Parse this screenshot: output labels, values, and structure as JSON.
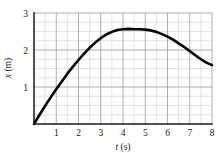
{
  "chart_data": {
    "type": "line",
    "title": "",
    "xlabel": "t (s)",
    "ylabel": "x (m)",
    "xlim": [
      0,
      8
    ],
    "ylim": [
      0,
      3
    ],
    "grid": true,
    "grid_major_x": 1,
    "grid_minor_x": 0.5,
    "grid_major_y": 1,
    "grid_minor_y": 0.25,
    "legend": "none",
    "xticks": [
      1,
      2,
      3,
      4,
      5,
      6,
      7,
      8
    ],
    "xtick_labels": [
      "1",
      "2",
      "3",
      "4",
      "5",
      "6",
      "7",
      "8"
    ],
    "yticks": [
      1,
      2,
      3
    ],
    "ytick_labels": [
      "1",
      "2",
      "3"
    ],
    "series": [
      {
        "name": "position",
        "color": "#000000",
        "linewidth": 2.6,
        "x": [
          0.0,
          0.25,
          0.5,
          0.75,
          1.0,
          1.25,
          1.5,
          1.75,
          2.0,
          2.25,
          2.5,
          2.75,
          3.0,
          3.25,
          3.5,
          3.75,
          4.0,
          4.25,
          4.5,
          4.75,
          5.0,
          5.25,
          5.5,
          5.75,
          6.0,
          6.25,
          6.5,
          6.75,
          7.0,
          7.25,
          7.5,
          7.75,
          8.0
        ],
        "y": [
          0.0,
          0.25,
          0.49,
          0.72,
          0.94,
          1.15,
          1.36,
          1.55,
          1.73,
          1.9,
          2.06,
          2.2,
          2.32,
          2.42,
          2.49,
          2.54,
          2.56,
          2.57,
          2.56,
          2.56,
          2.55,
          2.53,
          2.49,
          2.43,
          2.36,
          2.28,
          2.18,
          2.08,
          1.97,
          1.86,
          1.75,
          1.66,
          1.59
        ]
      }
    ],
    "annotations": []
  },
  "axis": {
    "y_label_text": "x (m)",
    "y_label_italic": "x",
    "y_label_unit": " (m)",
    "x_label_italic": "t",
    "x_label_unit": " (s)"
  },
  "colors": {
    "curve": "#000000",
    "axis": "#1a1a1a",
    "grid_major": "#9a9a9a",
    "grid_minor": "#d0d0d0",
    "background": "#ffffff"
  }
}
